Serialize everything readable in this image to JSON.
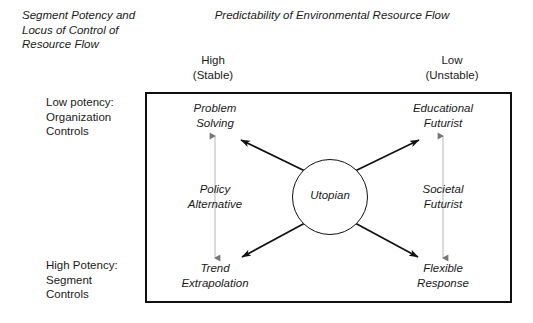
{
  "figure": {
    "axis_labels": {
      "vertical_heading": "Segment Potency and\nLocus of Control of\nResource Flow",
      "horizontal_heading": "Predictability of Environmental Resource Flow",
      "column_left": "High\n(Stable)",
      "column_right": "Low\n(Unstable)",
      "row_top": "Low potency:\nOrganization\nControls",
      "row_bottom": "High Potency:\nSegment\nControls"
    },
    "center": {
      "label": "Utopian"
    },
    "quadrants": [
      {
        "id": "top-left",
        "label": "Problem\nSolving"
      },
      {
        "id": "top-right",
        "label": "Educational\nFuturist"
      },
      {
        "id": "middle-left",
        "label": "Policy\nAlternative"
      },
      {
        "id": "middle-right",
        "label": "Societal\nFuturist"
      },
      {
        "id": "bottom-left",
        "label": "Trend\nExtrapolation"
      },
      {
        "id": "bottom-right",
        "label": "Flexible\nResponse"
      }
    ],
    "colors": {
      "stroke": "#111111",
      "thin_arrow": "#b4b4b4",
      "text": "#1a1a1a",
      "background": "#ffffff"
    }
  }
}
